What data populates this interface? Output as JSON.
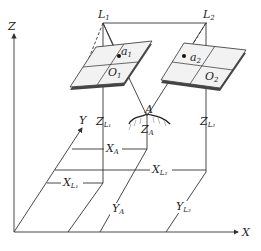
{
  "diagram": {
    "axes": {
      "x": "X",
      "y": "Y",
      "z": "Z"
    },
    "stations": [
      {
        "center": "L",
        "center_sub": "1",
        "image_point": "a",
        "image_sub": "1",
        "principal": "O",
        "principal_sub": "1"
      },
      {
        "center": "L",
        "center_sub": "2",
        "image_point": "a",
        "image_sub": "2",
        "principal": "O",
        "principal_sub": "2"
      }
    ],
    "ground_point": "A",
    "labels": {
      "ZL1": {
        "main": "Z",
        "sub": "L₁"
      },
      "ZA": {
        "main": "Z",
        "sub": "A"
      },
      "ZL2": {
        "main": "Z",
        "sub": "L₂"
      },
      "XA": {
        "main": "X",
        "sub": "A"
      },
      "XL1": {
        "main": "X",
        "sub": "L₁"
      },
      "XL2": {
        "main": "X",
        "sub": "L₂"
      },
      "YA": {
        "main": "Y",
        "sub": "A"
      },
      "YL2": {
        "main": "Y",
        "sub": "L₂"
      }
    },
    "colors": {
      "line": "#333333",
      "plate": "#f2f2f2",
      "plate_edge": "#444444",
      "terrain": "#555555"
    }
  }
}
